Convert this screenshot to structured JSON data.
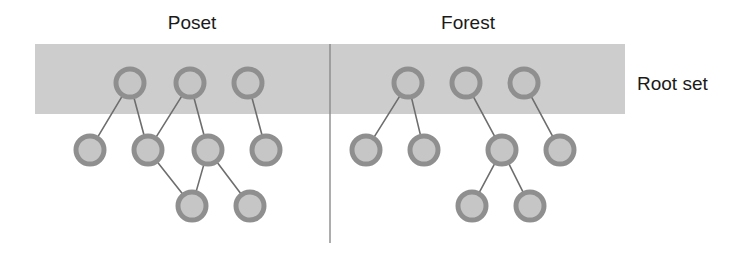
{
  "figure": {
    "width": 746,
    "height": 259,
    "background": "#ffffff"
  },
  "colors": {
    "band": "#cdcdcd",
    "node_ring": "#8f8f8f",
    "node_fill": "#c6c6c6",
    "edge": "#6e6e6e",
    "divider": "#8a8a8a",
    "text": "#1a1a1a"
  },
  "band": {
    "label": "Root set",
    "x": 35,
    "y": 44,
    "width": 590,
    "height": 70,
    "label_x": 637,
    "label_y": 90
  },
  "divider": {
    "x": 330,
    "y1": 44,
    "y2": 243,
    "width": 1.4
  },
  "node_style": {
    "radius": 14,
    "ring_width": 5
  },
  "edge_style": {
    "width": 1.6
  },
  "panels": [
    {
      "id": "poset",
      "title": "Poset",
      "title_x": 192,
      "title_y": 29,
      "nodes": [
        {
          "id": "p-t1",
          "x": 130,
          "y": 83,
          "row": "top",
          "in_root_set": true
        },
        {
          "id": "p-t2",
          "x": 190,
          "y": 83,
          "row": "top",
          "in_root_set": true
        },
        {
          "id": "p-t3",
          "x": 248,
          "y": 83,
          "row": "top",
          "in_root_set": true
        },
        {
          "id": "p-m1",
          "x": 90,
          "y": 150,
          "row": "middle",
          "in_root_set": false
        },
        {
          "id": "p-m2",
          "x": 148,
          "y": 150,
          "row": "middle",
          "in_root_set": false
        },
        {
          "id": "p-m3",
          "x": 208,
          "y": 150,
          "row": "middle",
          "in_root_set": false
        },
        {
          "id": "p-m4",
          "x": 266,
          "y": 150,
          "row": "middle",
          "in_root_set": false
        },
        {
          "id": "p-b1",
          "x": 192,
          "y": 206,
          "row": "bottom",
          "in_root_set": false
        },
        {
          "id": "p-b2",
          "x": 250,
          "y": 206,
          "row": "bottom",
          "in_root_set": false
        }
      ],
      "edges": [
        {
          "from": "p-t1",
          "to": "p-m1"
        },
        {
          "from": "p-t1",
          "to": "p-m2"
        },
        {
          "from": "p-t2",
          "to": "p-m2"
        },
        {
          "from": "p-t2",
          "to": "p-m3"
        },
        {
          "from": "p-t3",
          "to": "p-m4"
        },
        {
          "from": "p-m2",
          "to": "p-b1"
        },
        {
          "from": "p-m3",
          "to": "p-b1"
        },
        {
          "from": "p-m3",
          "to": "p-b2"
        }
      ]
    },
    {
      "id": "forest",
      "title": "Forest",
      "title_x": 468,
      "title_y": 29,
      "nodes": [
        {
          "id": "f-t1",
          "x": 408,
          "y": 83,
          "row": "top",
          "in_root_set": true
        },
        {
          "id": "f-t2",
          "x": 466,
          "y": 83,
          "row": "top",
          "in_root_set": true
        },
        {
          "id": "f-t3",
          "x": 524,
          "y": 83,
          "row": "top",
          "in_root_set": true
        },
        {
          "id": "f-m1",
          "x": 366,
          "y": 150,
          "row": "middle",
          "in_root_set": false
        },
        {
          "id": "f-m2",
          "x": 424,
          "y": 150,
          "row": "middle",
          "in_root_set": false
        },
        {
          "id": "f-m3",
          "x": 502,
          "y": 150,
          "row": "middle",
          "in_root_set": false
        },
        {
          "id": "f-m4",
          "x": 560,
          "y": 150,
          "row": "middle",
          "in_root_set": false
        },
        {
          "id": "f-b1",
          "x": 472,
          "y": 206,
          "row": "bottom",
          "in_root_set": false
        },
        {
          "id": "f-b2",
          "x": 530,
          "y": 206,
          "row": "bottom",
          "in_root_set": false
        }
      ],
      "edges": [
        {
          "from": "f-t1",
          "to": "f-m1"
        },
        {
          "from": "f-t1",
          "to": "f-m2"
        },
        {
          "from": "f-t2",
          "to": "f-m3"
        },
        {
          "from": "f-t3",
          "to": "f-m4"
        },
        {
          "from": "f-m3",
          "to": "f-b1"
        },
        {
          "from": "f-m3",
          "to": "f-b2"
        }
      ]
    }
  ]
}
